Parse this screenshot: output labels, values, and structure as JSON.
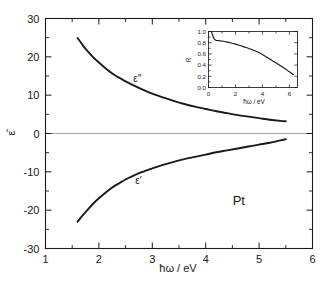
{
  "figure": {
    "background_color": "#ffffff",
    "line_color": "#1a1a1a",
    "zero_line_color": "#9a9a9a",
    "sample_label": "Pt"
  },
  "chart_data": {
    "type": "line",
    "title": "",
    "xlabel": "ħω / eV",
    "ylabel": "ε̂",
    "xlim": [
      1,
      6
    ],
    "ylim": [
      -30,
      30
    ],
    "grid": false,
    "legend_position": "inline-annotations",
    "xticks": [
      1,
      2,
      3,
      4,
      5,
      6
    ],
    "xtick_labels": [
      "1",
      "2",
      "3",
      "4",
      "5",
      "6"
    ],
    "xminor_ticks": [
      1.5,
      2.5,
      3.5,
      4.5,
      5.5
    ],
    "yticks": [
      -30,
      -20,
      -10,
      0,
      10,
      20,
      30
    ],
    "ytick_labels": [
      "-30",
      "-20",
      "-10",
      "0",
      "10",
      "20",
      "30"
    ],
    "yminor_ticks": [
      -25,
      -15,
      -5,
      5,
      15,
      25
    ],
    "annotations": [
      {
        "text": "ε″",
        "x": 2.72,
        "y": 13.4
      },
      {
        "text": "ε′",
        "x": 2.74,
        "y": -13.2
      },
      {
        "text": "Pt",
        "x": 4.62,
        "y": -18.6
      }
    ],
    "series": [
      {
        "name": "ε″",
        "label": "epsilon-imaginary",
        "x": [
          1.6,
          1.7,
          1.8,
          1.9,
          2.0,
          2.1,
          2.2,
          2.3,
          2.4,
          2.5,
          2.6,
          2.8,
          3.0,
          3.2,
          3.4,
          3.6,
          3.8,
          4.0,
          4.2,
          4.4,
          4.6,
          4.8,
          5.0,
          5.2,
          5.4,
          5.5
        ],
        "y": [
          24.9,
          23.0,
          21.3,
          19.8,
          18.5,
          17.3,
          16.2,
          15.2,
          14.4,
          13.6,
          12.9,
          11.6,
          10.4,
          9.4,
          8.5,
          7.7,
          7.0,
          6.4,
          5.8,
          5.3,
          4.8,
          4.4,
          4.0,
          3.6,
          3.3,
          3.2
        ]
      },
      {
        "name": "ε′",
        "label": "epsilon-real",
        "x": [
          1.6,
          1.7,
          1.8,
          1.9,
          2.0,
          2.1,
          2.2,
          2.3,
          2.4,
          2.5,
          2.6,
          2.8,
          3.0,
          3.2,
          3.4,
          3.6,
          3.8,
          4.0,
          4.2,
          4.4,
          4.6,
          4.8,
          5.0,
          5.2,
          5.4,
          5.5
        ],
        "y": [
          -23.0,
          -21.3,
          -19.7,
          -18.2,
          -16.9,
          -15.7,
          -14.6,
          -13.6,
          -12.8,
          -12.0,
          -11.3,
          -10.1,
          -9.1,
          -8.2,
          -7.4,
          -6.7,
          -6.1,
          -5.5,
          -4.9,
          -4.4,
          -3.9,
          -3.4,
          -2.9,
          -2.4,
          -1.8,
          -1.5
        ]
      }
    ]
  },
  "inset_chart_data": {
    "type": "line",
    "title": "",
    "xlabel": "ħω / eV",
    "ylabel": "R",
    "xlim": [
      0,
      6.6
    ],
    "ylim": [
      0.0,
      1.0
    ],
    "grid": false,
    "xticks": [
      0,
      2,
      4,
      6
    ],
    "xtick_labels": [
      "0",
      "2",
      "4",
      "6"
    ],
    "xminor_ticks": [
      1,
      3,
      5
    ],
    "yticks": [
      0.0,
      0.2,
      0.4,
      0.6,
      0.8,
      1.0
    ],
    "ytick_labels": [
      "0.0",
      "0.2",
      "0.4",
      "0.6",
      "0.8",
      "1.0"
    ],
    "yminor_ticks": [
      0.1,
      0.3,
      0.5,
      0.7,
      0.9
    ],
    "series": [
      {
        "name": "R",
        "label": "reflectivity",
        "x": [
          0.2,
          0.3,
          0.4,
          0.5,
          0.6,
          0.8,
          1.0,
          1.3,
          1.6,
          2.0,
          2.4,
          2.8,
          3.2,
          3.6,
          4.0,
          4.4,
          4.8,
          5.2,
          5.6,
          6.0,
          6.3
        ],
        "y": [
          1.0,
          0.94,
          0.88,
          0.85,
          0.84,
          0.835,
          0.83,
          0.815,
          0.8,
          0.775,
          0.745,
          0.715,
          0.68,
          0.64,
          0.59,
          0.53,
          0.47,
          0.41,
          0.35,
          0.28,
          0.23
        ]
      }
    ]
  }
}
